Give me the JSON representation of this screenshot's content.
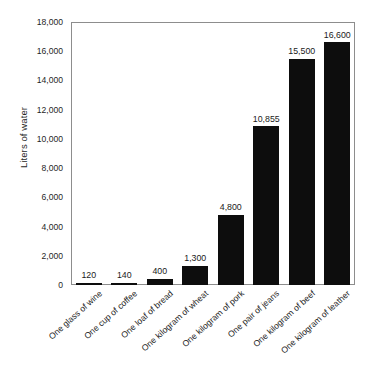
{
  "chart_data": {
    "type": "bar",
    "title": "",
    "subtitle": "",
    "xlabel": "",
    "ylabel": "Liters of water",
    "ylim": [
      0,
      18000
    ],
    "ytick_step": 2000,
    "grid": false,
    "legend": null,
    "bar_color": "#0d0d0d",
    "frame_color": "#8d8d8d",
    "background_color": "#ffffff",
    "value_labels_shown": true,
    "yticks": [
      "0",
      "2,000",
      "4,000",
      "6,000",
      "8,000",
      "10,000",
      "12,000",
      "14,000",
      "16,000",
      "18,000"
    ],
    "ytick_values": [
      0,
      2000,
      4000,
      6000,
      8000,
      10000,
      12000,
      14000,
      16000,
      18000
    ],
    "categories": [
      "One glass of wine",
      "One cup of coffee",
      "One loaf of bread",
      "One kilogram of wheat",
      "One kilogram of pork",
      "One pair of jeans",
      "One kilogram of beef",
      "One kilogram of leather"
    ],
    "values": [
      120,
      140,
      400,
      1300,
      4800,
      10855,
      15500,
      16600
    ],
    "value_labels": [
      "120",
      "140",
      "400",
      "1,300",
      "4,800",
      "10,855",
      "15,500",
      "16,600"
    ]
  }
}
